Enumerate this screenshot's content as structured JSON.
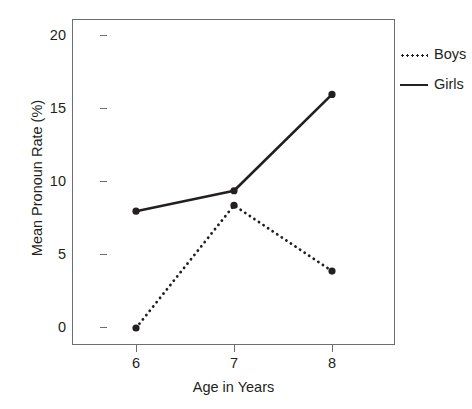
{
  "chart_data": {
    "type": "line",
    "title": "",
    "xlabel": "Age in Years",
    "ylabel": "Mean Pronoun Rate (%)",
    "x": [
      6,
      7,
      8
    ],
    "xtick_labels": [
      "6",
      "7",
      "8"
    ],
    "ytick_labels": [
      "0",
      "5",
      "10",
      "15",
      "20"
    ],
    "ytick_values": [
      0,
      5,
      10,
      15,
      20
    ],
    "ylim": [
      -0.5,
      21.5
    ],
    "xlim": [
      5.4,
      8.6
    ],
    "grid": false,
    "legend_position": "right",
    "series": [
      {
        "name": "Boys",
        "values": [
          0.0,
          8.4,
          3.9
        ],
        "style": "dotted",
        "color": "#231f20",
        "marker": "circle"
      },
      {
        "name": "Girls",
        "values": [
          8.0,
          9.4,
          16.0
        ],
        "style": "solid",
        "color": "#231f20",
        "marker": "circle"
      }
    ]
  },
  "axes": {
    "y_title": "Mean Pronoun Rate (%)",
    "x_title": "Age in Years",
    "y_ticks": [
      "20",
      "15",
      "10",
      "5",
      "0"
    ],
    "x_ticks": [
      "6",
      "7",
      "8"
    ]
  },
  "legend": {
    "entries": [
      {
        "label": "Boys",
        "swatch": "dotted-line-swatch"
      },
      {
        "label": "Girls",
        "swatch": "solid-line-swatch"
      }
    ]
  },
  "colors": {
    "ink": "#231f20",
    "frame": "#6d6e71",
    "background": "#ffffff"
  }
}
